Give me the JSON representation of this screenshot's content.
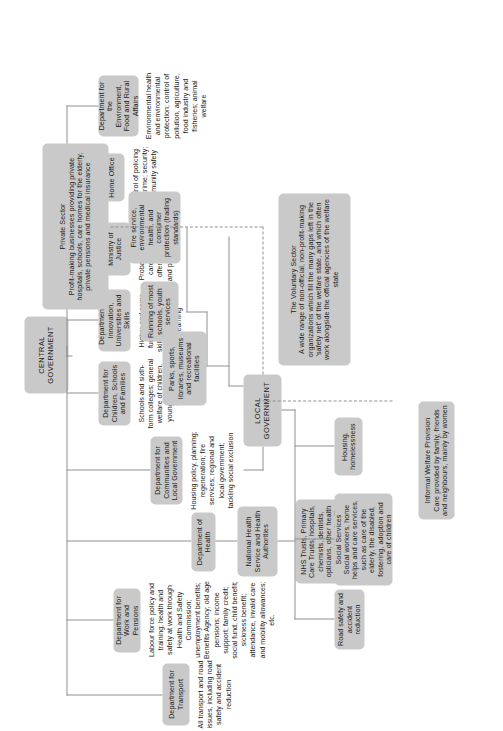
{
  "diagram": {
    "type": "organizational-chart",
    "palette": {
      "node_fill": "#c9c9c9",
      "connector": "#8f8f8f",
      "text": "#1b1b1b",
      "background": "#ffffff"
    }
  },
  "central_government": {
    "root_label": "CENTRAL GOVERNMENT",
    "departments": [
      {
        "name": "Department for Transport",
        "description": "All transport and road issues, including road safety and accident reduction"
      },
      {
        "name": "Department for Work and Pensions",
        "description": "Labour force policy and training; health and safety at work through Health and Safety Commission; unemployment benefits; Benefits Agency; old age pensions; income support; family credit; social fund; child benefit; sickness benefit; attendance, invalid care and mobility allowances; etc."
      },
      {
        "name": "Department of Health",
        "description": "",
        "child": {
          "name": "National Health Service and Health Authorities",
          "description": "NHS Trusts, Primary Care Trusts, hospitals, chemists, dentists, opticians, other health care services, health promotion"
        }
      },
      {
        "name": "Department for Communities and Local Government",
        "description": "Housing policy, planning; regeneration; fire services; regional and local government; tackling social exclusion"
      },
      {
        "name": "Department for Children, Schools and Families",
        "description": "Schools and sixth-form colleges; general welfare of children, young people and families"
      },
      {
        "name": "Department for Innovation, Universities and Skills",
        "description": "Higher and some further education; skills and workplace training; adult learning"
      },
      {
        "name": "Ministry of Justice",
        "description": "Probation and after-care services for offenders; prisons and prisoner welfare"
      },
      {
        "name": "Home Office",
        "description": "Control of policing and crime; security; community safety"
      },
      {
        "name": "Department for the Environment, Food and Rural Affairs",
        "description": "Environmental health and environmental protection; control of pollution, agriculture, food industry and fisheries; animal welfare"
      }
    ]
  },
  "local_government": {
    "root_label": "LOCAL GOVERNMENT",
    "services": [
      {
        "name": "Road safety and accident reduction",
        "description": ""
      },
      {
        "name": "Social Services",
        "description": "Social workers, home helps and care services, such as care of the elderly, the disabled, fostering, adoption and care of children"
      },
      {
        "name": "Housing, homelessness",
        "description": ""
      },
      {
        "name": "Parks, sports, libraries, museums and recreational facilities",
        "description": ""
      },
      {
        "name": "Running of most schools, youth services",
        "description": ""
      },
      {
        "name": "Fire service, environmental health, and consumer protection (trading standards)",
        "description": ""
      }
    ]
  },
  "other_sectors": [
    {
      "name": "Informal Welfare Provision",
      "description": "Care provided by family, friends and neighbours, mainly by women"
    },
    {
      "name": "The Voluntary Sector",
      "description": "A wide range of non-official, non-profit-making organizations which fill the many gaps left in the 'safety net' of the welfare state, and which often work alongside the official agencies of the welfare state"
    },
    {
      "name": "Private Sector",
      "description": "Profit-making businesses providing private hospitals, schools, care homes for the elderly, private pensions and medical insurance"
    }
  ]
}
